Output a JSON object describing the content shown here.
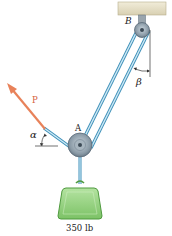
{
  "diagram": {
    "labels": {
      "support_point": "B",
      "pulley_point": "A",
      "force": "P",
      "angle_force": "α",
      "angle_cable": "β",
      "load": "350 lb"
    },
    "colors": {
      "cable": "#7fc4e3",
      "cable_edge": "#3c8fb8",
      "force_arrow": "#e8825a",
      "weight_fill": "#8fd07a",
      "weight_edge": "#4f9a3f",
      "ceiling": "#e9e4cf",
      "ceiling_edge": "#b7ae8c",
      "pulley_fill": "#8a9aa6",
      "pulley_edge": "#5b6b78"
    }
  }
}
